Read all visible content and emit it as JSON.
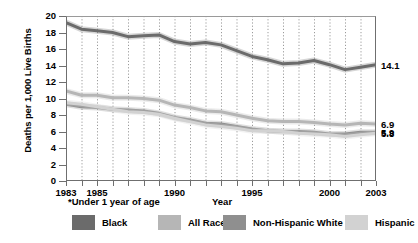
{
  "chart_data": {
    "type": "line",
    "title": "",
    "xlabel": "Year",
    "ylabel": "Deaths per 1,000 Live Births",
    "footnote": "*Under 1 year of age",
    "xlim": [
      1983,
      2003
    ],
    "ylim": [
      0,
      20
    ],
    "ytick_step": 2,
    "yticks": [
      0,
      2,
      4,
      6,
      8,
      10,
      12,
      14,
      16,
      18,
      20
    ],
    "xticks": [
      1983,
      1984,
      1985,
      1986,
      1987,
      1988,
      1989,
      1990,
      1991,
      1992,
      1993,
      1994,
      1995,
      1996,
      1997,
      1998,
      1999,
      2000,
      2001,
      2002,
      2003
    ],
    "xtick_labels": [
      {
        "year": 1983,
        "label": "1983"
      },
      {
        "year": 1985,
        "label": "1985"
      },
      {
        "year": 1990,
        "label": "1990"
      },
      {
        "year": 1995,
        "label": "1995"
      },
      {
        "year": 2000,
        "label": "2000"
      },
      {
        "year": 2003,
        "label": "2003"
      }
    ],
    "grid": "vertical-dotted",
    "legend_position": "bottom",
    "x": [
      1983,
      1984,
      1985,
      1986,
      1987,
      1988,
      1989,
      1990,
      1991,
      1992,
      1993,
      1994,
      1995,
      1996,
      1997,
      1998,
      1999,
      2000,
      2001,
      2002,
      2003
    ],
    "series": [
      {
        "name": "Black",
        "color": "#6b6b6b",
        "end_label": "14.1",
        "values": [
          19.2,
          18.4,
          18.2,
          18.0,
          17.5,
          17.6,
          17.7,
          16.9,
          16.6,
          16.8,
          16.5,
          15.8,
          15.1,
          14.7,
          14.2,
          14.3,
          14.6,
          14.1,
          13.5,
          13.8,
          14.1
        ]
      },
      {
        "name": "All Races",
        "color": "#b6b6b6",
        "end_label": "6.9",
        "values": [
          10.9,
          10.4,
          10.4,
          10.1,
          10.1,
          10.0,
          9.8,
          9.2,
          8.9,
          8.5,
          8.4,
          8.0,
          7.6,
          7.3,
          7.2,
          7.2,
          7.1,
          6.9,
          6.8,
          7.0,
          6.9
        ]
      },
      {
        "name": "Non-Hispanic White",
        "color": "#8f8f8f",
        "end_label": "5.9",
        "values": [
          9.3,
          9.0,
          8.9,
          8.7,
          8.6,
          8.5,
          8.2,
          7.7,
          7.4,
          7.0,
          6.9,
          6.6,
          6.3,
          6.1,
          6.0,
          6.0,
          5.9,
          5.7,
          5.7,
          5.9,
          5.9
        ]
      },
      {
        "name": "Hispanic",
        "color": "#d2d2d2",
        "end_label": "5.8",
        "values": [
          9.5,
          9.3,
          9.0,
          8.7,
          8.4,
          8.3,
          8.1,
          7.6,
          7.2,
          6.8,
          6.6,
          6.4,
          6.1,
          6.1,
          6.0,
          5.8,
          5.7,
          5.6,
          5.4,
          5.6,
          5.8
        ]
      }
    ]
  },
  "legend": {
    "items": [
      {
        "label": "Black",
        "color": "#6b6b6b",
        "left": 72
      },
      {
        "label": "All Races",
        "color": "#b6b6b6",
        "left": 158
      },
      {
        "label": "Non-Hispanic White",
        "color": "#8f8f8f",
        "left": 223
      },
      {
        "label": "Hispanic",
        "color": "#d2d2d2",
        "left": 345
      }
    ]
  }
}
